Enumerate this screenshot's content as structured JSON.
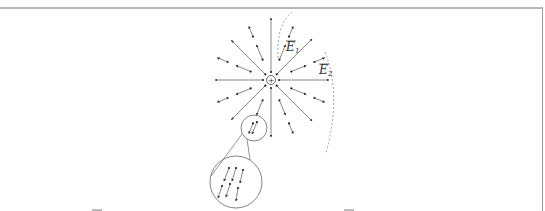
{
  "figure": {
    "charge": {
      "symbol": "+",
      "cx": 271,
      "cy": 80,
      "r": 4.5
    },
    "labels": [
      {
        "id": "E1",
        "text": "E",
        "sub": "1",
        "x": 287,
        "y": 50
      },
      {
        "id": "E2",
        "text": "E",
        "sub": "2",
        "x": 319,
        "y": 74
      }
    ],
    "zoom_circles": {
      "small": {
        "cx": 254,
        "cy": 128,
        "r": 13
      },
      "large": {
        "cx": 236,
        "cy": 182,
        "r": 26
      }
    },
    "colors": {
      "line": "#555555",
      "dot": "#222222",
      "dashed": "#888888",
      "frame": "#b8b8b8"
    }
  }
}
